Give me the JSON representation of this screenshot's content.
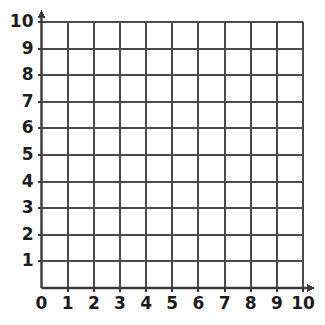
{
  "chart_data": {
    "type": "grid",
    "title": "",
    "subtitle": "",
    "xlabel": "",
    "ylabel": "",
    "xlim": [
      0,
      10
    ],
    "ylim": [
      0,
      10
    ],
    "x_ticks": [
      "0",
      "1",
      "2",
      "3",
      "4",
      "5",
      "6",
      "7",
      "8",
      "9",
      "10"
    ],
    "y_ticks": [
      "1",
      "2",
      "3",
      "4",
      "5",
      "6",
      "7",
      "8",
      "9",
      "10"
    ],
    "x_tick_values": [
      0,
      1,
      2,
      3,
      4,
      5,
      6,
      7,
      8,
      9,
      10
    ],
    "y_tick_values": [
      1,
      2,
      3,
      4,
      5,
      6,
      7,
      8,
      9,
      10
    ],
    "grid": true,
    "grid_step": 1,
    "legend": null,
    "series": [],
    "values": [],
    "annotations": [],
    "x_axis_arrow": true,
    "y_axis_arrow": true,
    "origin_label": "0",
    "colors": {
      "background": "#ffffff",
      "gridline": "#4a4a4a",
      "axis": "#3a3a3a",
      "label": "#1c1c1c"
    }
  },
  "figure": {
    "name": "blank-coordinate-grid"
  }
}
